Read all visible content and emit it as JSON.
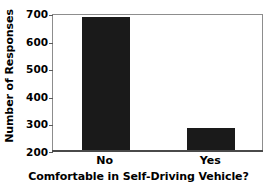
{
  "chart_data": {
    "type": "bar",
    "title": "",
    "subtitle": "",
    "xlabel": "Comfortable in Self-Driving Vehicle?",
    "ylabel": "Number of Responses",
    "categories": [
      "No",
      "Yes"
    ],
    "values": [
      685,
      283
    ],
    "series": [
      {
        "name": "Number of Responses",
        "values": [
          685,
          283
        ]
      }
    ],
    "ylim": [
      200,
      700
    ],
    "yticks": [
      200,
      300,
      400,
      500,
      600,
      700
    ],
    "ytick_labels": [
      "200",
      "300",
      "400",
      "500",
      "600",
      "700"
    ],
    "grid": false,
    "legend": false,
    "legend_position": "none",
    "bar_color": "#1a1a1a",
    "frame_color": "#8d8d8d",
    "axis_color": "#4a4a4a",
    "background_color": "#ffffff",
    "annotations": []
  }
}
